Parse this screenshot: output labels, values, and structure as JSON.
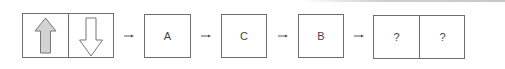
{
  "diagram": {
    "type": "sequence-puzzle",
    "start_panel": {
      "left_cell": {
        "icon": "arrow-up",
        "fill": "#d3d3d3",
        "stroke": "#777777"
      },
      "right_cell": {
        "icon": "arrow-down",
        "fill": "#ffffff",
        "stroke": "#777777"
      }
    },
    "steps": [
      {
        "label": "A"
      },
      {
        "label": "C"
      },
      {
        "label": "B"
      }
    ],
    "answer_panel": {
      "left_label": "?",
      "right_label": "?"
    },
    "connector_symbol": "→",
    "colors": {
      "border": "#6e6e6e",
      "text": "#444444",
      "arrow_fill": "#d3d3d3"
    }
  }
}
